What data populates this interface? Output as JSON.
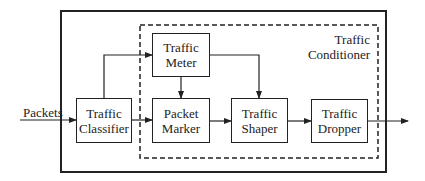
{
  "diagram": {
    "input_label": "Packets",
    "container_label": [
      "Traffic",
      "Conditioner"
    ],
    "nodes": {
      "classifier": [
        "Traffic",
        "Classifier"
      ],
      "meter": [
        "Traffic",
        "Meter"
      ],
      "marker": [
        "Packet",
        "Marker"
      ],
      "shaper": [
        "Traffic",
        "Shaper"
      ],
      "dropper": [
        "Traffic",
        "Dropper"
      ]
    },
    "edges": [
      {
        "from": "input",
        "to": "classifier"
      },
      {
        "from": "classifier",
        "to": "meter"
      },
      {
        "from": "classifier",
        "to": "marker"
      },
      {
        "from": "meter",
        "to": "marker"
      },
      {
        "from": "meter",
        "to": "shaper"
      },
      {
        "from": "marker",
        "to": "shaper"
      },
      {
        "from": "shaper",
        "to": "dropper"
      },
      {
        "from": "dropper",
        "to": "output"
      }
    ]
  }
}
